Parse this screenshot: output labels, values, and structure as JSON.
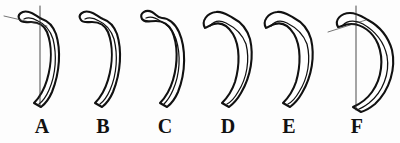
{
  "figure": {
    "type": "anatomical-line-drawing",
    "background_color": "#fdfdfd",
    "outline_color": "#111111",
    "measure_line_color": "#2a2a2a",
    "panels": [
      {
        "id": "panel-a",
        "label": "A",
        "label_x": 42,
        "has_measure_lines": true,
        "measure": {
          "vertical_line": {
            "x": 40,
            "y1": 6,
            "y2": 107
          },
          "diagonal_line": {
            "x1": 4,
            "y1": 16,
            "x2": 47,
            "y2": 26
          }
        },
        "outer_path": "M 20 20 C 16 15, 22 10, 29 12 C 34 13, 37 17, 42 19 C 48 21, 53 26, 56 34 C 61 50, 60 72, 52 92 C 49 99, 45 104, 41 107 L 34 103 C 39 98, 44 90, 47 80 C 52 63, 52 45, 47 32 C 44 25, 38 22, 31 22 C 26 22, 22 23, 20 20 Z",
        "inner_path": "M 24 19 C 28 17, 33 18, 38 21 C 45 24, 50 30, 53 39 C 57 55, 56 74, 49 90 C 46 97, 43 101, 39 104"
      },
      {
        "id": "panel-b",
        "label": "B",
        "label_x": 103,
        "has_measure_lines": false,
        "outer_path": "M 81 20 C 77 15, 83 10, 90 12 C 95 13, 98 17, 103 19 C 109 21, 114 26, 117 34 C 122 50, 121 72, 113 92 C 110 99, 106 104, 102 107 L 95 103 C 100 98, 105 90, 108 80 C 113 63, 113 45, 108 32 C 105 25, 99 22, 92 22 C 87 22, 83 23, 81 20 Z",
        "inner_path": "M 85 19 C 89 17, 94 18, 99 21 C 106 24, 111 30, 114 39 C 118 55, 117 74, 110 90 C 107 97, 104 101, 100 104"
      },
      {
        "id": "panel-c",
        "label": "C",
        "label_x": 165,
        "has_measure_lines": false,
        "outer_path": "M 142 19 C 139 13, 146 9, 152 12 C 156 14, 157 18, 162 18 C 168 18, 175 23, 179 32 C 186 48, 186 72, 178 92 C 175 99, 171 104, 167 107 L 160 103 C 165 98, 170 90, 173 80 C 178 63, 178 44, 172 31 C 169 25, 163 21, 156 21 C 149 21, 145 23, 142 19 Z",
        "inner_path": "M 146 18 C 151 16, 156 18, 160 21 C 167 24, 173 30, 176 39 C 181 55, 180 74, 173 90 C 170 97, 167 101, 164 104"
      },
      {
        "id": "panel-d",
        "label": "D",
        "label_x": 228,
        "has_measure_lines": false,
        "outer_path": "M 205 28 C 201 21, 207 13, 216 12 C 223 11, 227 15, 233 18 C 241 22, 247 29, 250 39 C 254 56, 251 76, 241 93 C 237 100, 233 104, 229 107 L 222 103 C 227 98, 232 91, 235 82 C 240 65, 240 46, 233 34 C 228 26, 221 22, 214 24 C 209 25, 207 28, 205 28 Z",
        "inner_path": "M 210 26 C 214 21, 220 20, 226 23 C 234 27, 242 33, 246 44 C 250 60, 247 78, 238 92 C 234 99, 231 102, 227 104"
      },
      {
        "id": "panel-e",
        "label": "E",
        "label_x": 289,
        "has_measure_lines": false,
        "outer_path": "M 266 28 C 262 21, 268 13, 277 12 C 284 11, 288 15, 294 18 C 302 22, 308 29, 311 39 C 315 56, 312 76, 302 93 C 298 100, 294 104, 290 107 L 283 103 C 288 98, 293 91, 296 82 C 301 65, 301 46, 294 34 C 289 26, 282 22, 275 24 C 270 25, 268 28, 266 28 Z",
        "inner_path": "M 271 26 C 275 21, 281 20, 287 23 C 295 27, 303 33, 307 44 C 311 60, 308 78, 299 92 C 295 99, 292 102, 288 104"
      },
      {
        "id": "panel-f",
        "label": "F",
        "label_x": 357,
        "has_measure_lines": true,
        "measure": {
          "vertical_line": {
            "x": 356,
            "y1": 6,
            "y2": 110
          },
          "diagonal_line": {
            "x1": 328,
            "y1": 32,
            "x2": 366,
            "y2": 20
          }
        },
        "outer_path": "M 338 27 C 334 20, 341 13, 350 13 C 357 13, 361 16, 368 20 C 379 26, 388 36, 392 50 C 396 68, 390 90, 375 104 C 370 108, 365 111, 361 112 L 353 107 C 360 104, 367 99, 372 92 C 382 78, 384 59, 378 44 C 373 32, 362 24, 351 24 C 344 24, 341 27, 338 27 Z",
        "inner_path": "M 343 25 C 348 20, 356 20, 363 24 C 375 31, 384 42, 387 56 C 390 73, 383 92, 369 103 C 365 106, 362 108, 359 109"
      }
    ]
  }
}
